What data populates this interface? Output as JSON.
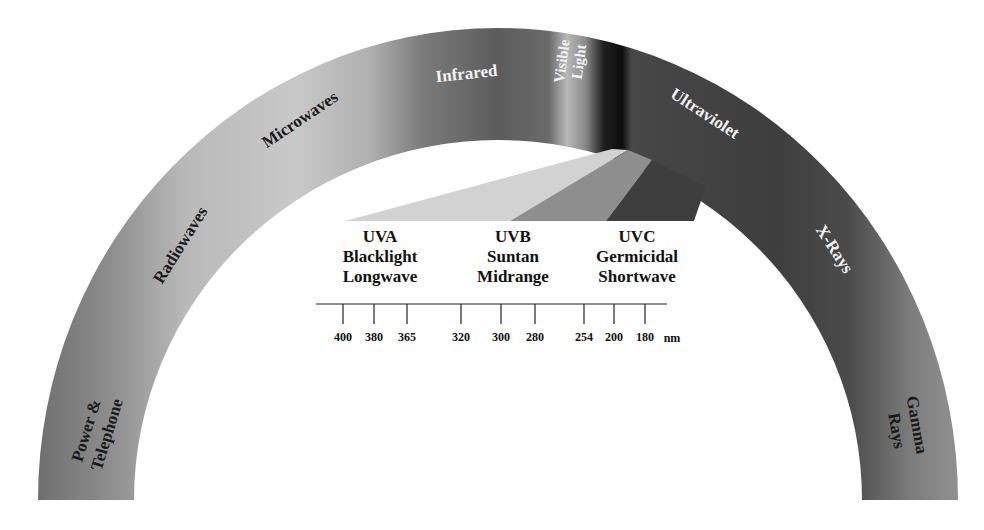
{
  "diagram": {
    "title": "",
    "type": "electromagnetic-spectrum-arch",
    "bands": [
      {
        "id": "power",
        "label_line1": "Power &",
        "label_line2": "Telephone",
        "color": "#7a7a7a"
      },
      {
        "id": "radio",
        "label": "Radiowaves",
        "color": "#b8b8b8"
      },
      {
        "id": "micro",
        "label": "Microwaves",
        "color": "#c4c4c4"
      },
      {
        "id": "infrared",
        "label": "Infrared",
        "color": "#5e5e5e"
      },
      {
        "id": "visible",
        "label_line1": "Visible",
        "label_line2": "Light",
        "color": "#9a9a9a"
      },
      {
        "id": "uv",
        "label": "Ultraviolet",
        "color": "#454545"
      },
      {
        "id": "xray",
        "label": "X-Rays",
        "color": "#3d3d3d"
      },
      {
        "id": "gamma",
        "label_line1": "Gamma",
        "label_line2": "Rays",
        "color": "#8a8a8a"
      }
    ],
    "uv_breakdown": [
      {
        "id": "uva",
        "name": "UVA",
        "line2": "Blacklight",
        "line3": "Longwave",
        "wedge_color": "#d2d2d2"
      },
      {
        "id": "uvb",
        "name": "UVB",
        "line2": "Suntan",
        "line3": "Midrange",
        "wedge_color": "#8e8e8e"
      },
      {
        "id": "uvc",
        "name": "UVC",
        "line2": "Germicidal",
        "line3": "Shortwave",
        "wedge_color": "#3e3e3e"
      }
    ],
    "scale": {
      "unit": "nm",
      "ticks": [
        "400",
        "380",
        "365",
        "320",
        "300",
        "280",
        "254",
        "200",
        "180"
      ]
    }
  }
}
